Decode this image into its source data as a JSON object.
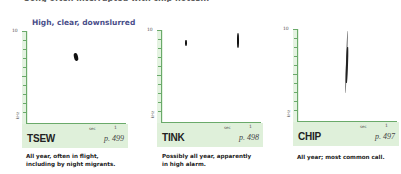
{
  "header": {
    "truncated_line": "Song often interrupted with chip notes...",
    "subtitle": "High, clear, downslurred"
  },
  "axis": {
    "y_top_label": "10",
    "y_unit": "kHz",
    "x_unit": "sec",
    "x_end_label": "1"
  },
  "panels": [
    {
      "name": "TSEW",
      "page": "p. 499",
      "caption_line1": "All year, often in flight,",
      "caption_line2": "including by night migrants."
    },
    {
      "name": "TINK",
      "page": "p. 498",
      "caption_line1": "Possibly all year, apparently",
      "caption_line2": "in high alarm."
    },
    {
      "name": "CHIP",
      "page": "p. 497",
      "caption_line1": "All year; most common call.",
      "caption_line2": ""
    }
  ],
  "colors": {
    "axis_green": "#6aaa6a",
    "band_green": "#dff0da",
    "subtitle_blue": "#4a4f8a"
  }
}
